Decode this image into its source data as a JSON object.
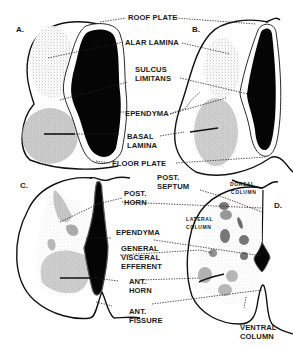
{
  "figure": {
    "panels": [
      {
        "id": "A",
        "letter": "A."
      },
      {
        "id": "B",
        "letter": "B."
      },
      {
        "id": "C",
        "letter": "C."
      },
      {
        "id": "D",
        "letter": "D."
      }
    ],
    "labels_top": {
      "roof_plate": "ROOF PLATE",
      "alar_lamina": "ALAR LAMINA",
      "sulcus_limitans_1": "SULCUS",
      "sulcus_limitans_2": "LIMITANS",
      "ependyma": "EPENDYMA",
      "basal_lamina_1": "BASAL",
      "basal_lamina_2": "LAMINA",
      "floor_plate": "FLOOR PLATE"
    },
    "labels_bottom": {
      "post_septum_1": "POST.",
      "post_septum_2": "SEPTUM",
      "post_horn_1": "POST.",
      "post_horn_2": "HORN",
      "ependyma": "EPENDYMA",
      "gve_1": "GENERAL",
      "gve_2": "VISCERAL",
      "gve_3": "EFFERENT",
      "ant_horn_1": "ANT.",
      "ant_horn_2": "HORN",
      "ant_fissure_1": "ANT.",
      "ant_fissure_2": "FISSURE",
      "ventral_column_1": "VENTRAL",
      "ventral_column_2": "COLUMN",
      "dorsal_column_1": "DORSAL",
      "dorsal_column_2": "COLUMN",
      "lateral_column_1": "LATERAL",
      "lateral_column_2": "COLUMN"
    },
    "colors": {
      "ink": "#111111",
      "background": "#ffffff",
      "stipple": "#777777"
    }
  }
}
